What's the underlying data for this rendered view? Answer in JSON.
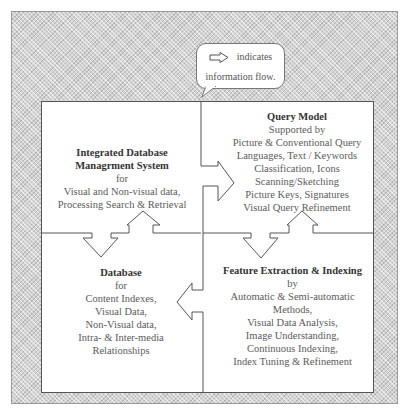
{
  "diagram": {
    "legend": {
      "icon": "right-arrow-outline-icon",
      "line1": "indicates",
      "line2": "information flow."
    },
    "blocks": {
      "integrated_dbms": {
        "title_line1": "Integrated Database",
        "title_line2": "Managrment System",
        "lines": [
          "for",
          "Visual and Non-visual data,",
          "Processing Search & Retrieval"
        ]
      },
      "query_model": {
        "title": "Query Model",
        "lines": [
          "Supported by",
          "Picture & Conventional Query",
          "Languages, Text / Keywords",
          "Classification, Icons",
          "Scanning/Sketching",
          "Picture Keys, Signatures",
          "Visual Query Refinement"
        ]
      },
      "database": {
        "title": "Database",
        "lines": [
          "for",
          "Content Indexes,",
          "Visual Data,",
          "Non-Visual data,",
          "Intra- & Inter-media",
          "Relationships"
        ]
      },
      "feature_extraction": {
        "title": "Feature Extraction & Indexing",
        "lines": [
          "by",
          "Automatic & Semi-automatic",
          "Methods,",
          "Visual Data Analysis,",
          "Image Understanding,",
          "Continuous Indexing,",
          "Index Tuning & Refinement"
        ]
      }
    },
    "flows": [
      {
        "from": "Integrated Database Managrment System",
        "to": "Query Model",
        "direction": "right"
      },
      {
        "from": "Feature Extraction & Indexing",
        "to": "Database",
        "direction": "left"
      },
      {
        "from": "Integrated Database Managrment System",
        "to": "Database",
        "direction": "down"
      },
      {
        "from": "Database",
        "to": "Integrated Database Managrment System",
        "direction": "up"
      },
      {
        "from": "Query Model",
        "to": "Feature Extraction & Indexing",
        "direction": "down"
      },
      {
        "from": "Feature Extraction & Indexing",
        "to": "Query Model",
        "direction": "up"
      }
    ],
    "colors": {
      "frame_background": "#d4d4d4",
      "box_background": "#ffffff",
      "line": "#555555",
      "text": "#5a5a5a"
    }
  }
}
